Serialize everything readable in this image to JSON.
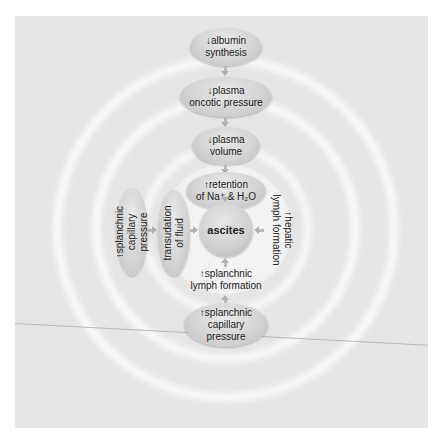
{
  "diagram": {
    "center": {
      "label": "ascites"
    },
    "top_chain": [
      {
        "label_line1": "↓albumin",
        "label_line2": "synthesis"
      },
      {
        "label_line1": "↓plasma",
        "label_line2": "oncotic pressure"
      },
      {
        "label_line1": "↓plasma",
        "label_line2": "volume"
      },
      {
        "label_line1": "↑retention",
        "label_line2": "of Na⁺ & H₂O"
      }
    ],
    "left_chain": [
      {
        "label_line1": "↑splanchnic",
        "label_line2": "capillary",
        "label_line3": "pressure"
      },
      {
        "label_line1": "transudation",
        "label_line2": "of fluid"
      }
    ],
    "right_node": {
      "label_line1": "↑hepatic",
      "label_line2": "lymph formation"
    },
    "bottom_chain": [
      {
        "label_line1": "↑splanchnic",
        "label_line2": "lymph formation"
      },
      {
        "label_line1": "↑splanchnic",
        "label_line2": "capillary",
        "label_line3": "pressure"
      }
    ],
    "colors": {
      "background": "#e6e6e6",
      "rings": "#ffffff",
      "node_fill": "#d4d4d4",
      "arrow": "#b0b0b0",
      "text": "#222222"
    }
  }
}
